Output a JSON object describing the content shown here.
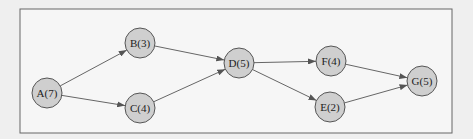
{
  "diagram": {
    "type": "precedence-network",
    "nodes": [
      {
        "id": "A",
        "label": "A(7)",
        "x": 47,
        "y": 93
      },
      {
        "id": "B",
        "label": "B(3)",
        "x": 140,
        "y": 43
      },
      {
        "id": "C",
        "label": "C(4)",
        "x": 140,
        "y": 108
      },
      {
        "id": "D",
        "label": "D(5)",
        "x": 239,
        "y": 63
      },
      {
        "id": "F",
        "label": "F(4)",
        "x": 331,
        "y": 61
      },
      {
        "id": "E",
        "label": "E(2)",
        "x": 330,
        "y": 107
      },
      {
        "id": "G",
        "label": "G(5)",
        "x": 422,
        "y": 81
      }
    ],
    "edges": [
      {
        "from": "A",
        "to": "B"
      },
      {
        "from": "A",
        "to": "C"
      },
      {
        "from": "B",
        "to": "D"
      },
      {
        "from": "C",
        "to": "D"
      },
      {
        "from": "D",
        "to": "F"
      },
      {
        "from": "D",
        "to": "E"
      },
      {
        "from": "F",
        "to": "G"
      },
      {
        "from": "E",
        "to": "G"
      }
    ],
    "colors": {
      "node_fill": "#cfcfcf",
      "node_stroke": "#555555",
      "edge": "#666666",
      "frame": "#666666",
      "background": "#f4f4f4"
    }
  }
}
